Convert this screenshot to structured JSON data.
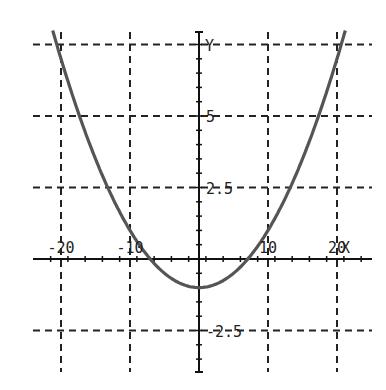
{
  "chart_data": {
    "type": "line",
    "title": "",
    "xlabel": "X",
    "ylabel": "Y",
    "xlim": [
      -20,
      20
    ],
    "ylim": [
      -4.3,
      7.9
    ],
    "grid": true,
    "x_gridlines": [
      -20,
      -10,
      10,
      20
    ],
    "y_gridlines": [
      -2.5,
      2.5,
      5,
      7.5
    ],
    "x_tick_labels": [
      "-20",
      "-10",
      "10",
      "20"
    ],
    "y_tick_labels": [
      "5",
      "2.5",
      "-2.5"
    ],
    "series": [
      {
        "name": "y = 0.02x^2 - 1",
        "function": "0.02*x*x - 1",
        "x": [
          -21,
          -20,
          -17.5,
          -15,
          -12.5,
          -10,
          -7.07,
          -5,
          -2.5,
          0,
          2.5,
          5,
          7.07,
          10,
          12.5,
          15,
          17.5,
          20,
          21
        ],
        "y": [
          7.82,
          7.0,
          5.13,
          3.5,
          2.13,
          1.0,
          0.0,
          -0.5,
          -0.88,
          -1.0,
          -0.88,
          -0.5,
          0.0,
          1.0,
          2.13,
          3.5,
          5.13,
          7.0,
          7.82
        ],
        "color": "#555555"
      }
    ],
    "colors": {
      "axis": "#111111",
      "grid": "#222222",
      "curve": "#555555",
      "background": "#ffffff"
    }
  }
}
